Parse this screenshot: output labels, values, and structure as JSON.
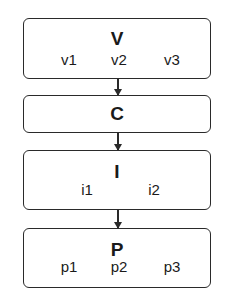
{
  "diagram": {
    "boxes": [
      {
        "title": "V",
        "items": [
          "v1",
          "v2",
          "v3"
        ]
      },
      {
        "title": "C",
        "items": []
      },
      {
        "title": "I",
        "items": [
          "i1",
          "i2"
        ]
      },
      {
        "title": "P",
        "items": [
          "p1",
          "p2",
          "p3"
        ]
      }
    ],
    "edges": [
      {
        "from": "V",
        "to": "C"
      },
      {
        "from": "C",
        "to": "I"
      },
      {
        "from": "I",
        "to": "P"
      }
    ],
    "colors": {
      "stroke": "#2a2a2a",
      "background": "#ffffff",
      "text": "#1a1a1a"
    }
  }
}
